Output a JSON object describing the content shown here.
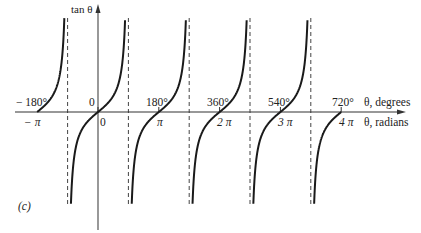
{
  "chart_data": {
    "type": "line",
    "title": "",
    "panel_label": "(c)",
    "ylabel": "tan θ",
    "xlabel_degrees": "θ, degrees",
    "xlabel_radians": "θ, radians",
    "function": "tan",
    "x_ticks_degrees": [
      "−180°",
      "0",
      "180°",
      "360°",
      "540°",
      "720°"
    ],
    "x_ticks_radians": [
      "−π",
      "0",
      "π",
      "2π",
      "3π",
      "4π"
    ],
    "x_tick_values_rad": [
      -3.1416,
      0,
      3.1416,
      6.2832,
      9.4248,
      12.5664
    ],
    "asymptotes_degrees": [
      -90,
      90,
      270,
      450,
      630
    ],
    "xlim_degrees": [
      -250,
      850
    ],
    "grid": false,
    "legend": null,
    "series": [
      {
        "name": "tan θ branch 1",
        "x_deg": [
          -180,
          -135,
          -90
        ],
        "y": [
          0,
          1,
          "+inf"
        ]
      },
      {
        "name": "tan θ branch 2",
        "x_deg": [
          -90,
          -45,
          0,
          45,
          90
        ],
        "y": [
          "-inf",
          -1,
          0,
          1,
          "+inf"
        ]
      },
      {
        "name": "tan θ branch 3",
        "x_deg": [
          90,
          135,
          180,
          225,
          270
        ],
        "y": [
          "-inf",
          -1,
          0,
          1,
          "+inf"
        ]
      },
      {
        "name": "tan θ branch 4",
        "x_deg": [
          270,
          315,
          360,
          405,
          450
        ],
        "y": [
          "-inf",
          -1,
          0,
          1,
          "+inf"
        ]
      },
      {
        "name": "tan θ branch 5",
        "x_deg": [
          450,
          495,
          540,
          585,
          630
        ],
        "y": [
          "-inf",
          -1,
          0,
          1,
          "+inf"
        ]
      },
      {
        "name": "tan θ branch 6",
        "x_deg": [
          630,
          675,
          720
        ],
        "y": [
          "-inf",
          -1,
          0
        ]
      }
    ]
  },
  "labels": {
    "ylabel": "tan θ",
    "deg_axis": "θ, degrees",
    "rad_axis": "θ, radians",
    "panel": "(c)",
    "deg_ticks": [
      "− 180°",
      "0",
      "180°",
      "360°",
      "540°",
      "720°"
    ],
    "rad_ticks": [
      "− π",
      "0",
      "π",
      "2 π",
      "3 π",
      "4 π"
    ]
  }
}
